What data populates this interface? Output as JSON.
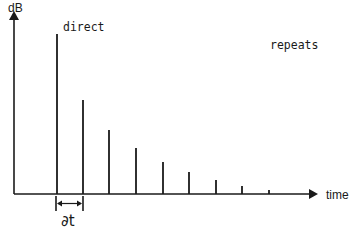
{
  "diagram": {
    "y_axis_label": "dB",
    "x_axis_label": "time",
    "direct_label": "direct",
    "repeats_label": "repeats",
    "interval_label": "∂t",
    "color": "#1a1a1a"
  },
  "chart_data": {
    "type": "bar",
    "title": "",
    "xlabel": "time",
    "ylabel": "dB",
    "categories": [
      "direct",
      "repeat 1",
      "repeat 2",
      "repeat 3",
      "repeat 4",
      "repeat 5",
      "repeat 6",
      "repeat 7",
      "repeat 8"
    ],
    "values": [
      160,
      94,
      64,
      46,
      32,
      22,
      14,
      8,
      4
    ],
    "units": "relative height (px above baseline)",
    "x_positions": [
      57,
      83,
      109,
      136,
      163,
      189,
      216,
      242,
      269
    ],
    "grid": false,
    "annotations": [
      "direct",
      "repeats",
      "∂t"
    ]
  }
}
